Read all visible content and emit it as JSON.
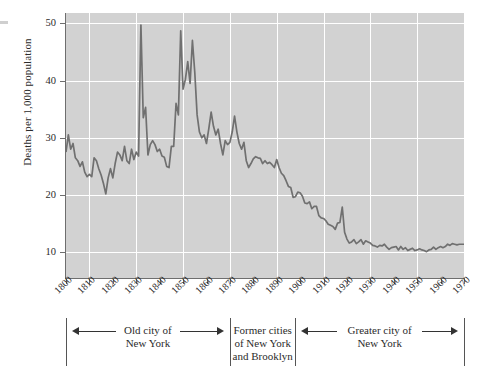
{
  "figure": {
    "kind": "line-chart",
    "background_color": "#ffffff",
    "plot_background_color": "#d2d2d2",
    "gridline_color": "#ffffff",
    "series_color": "#707070",
    "axis_color": "#6e6e6e"
  },
  "chart_data": {
    "type": "line",
    "title": "",
    "xlabel": "",
    "ylabel": "Deaths per 1,000 population",
    "xlim": [
      1800,
      1970
    ],
    "ylim": [
      5.5,
      51.8
    ],
    "grid": true,
    "legend": null,
    "yticks": [
      10,
      20,
      30,
      40,
      50
    ],
    "ytick_labels": [
      "10",
      "20",
      "30",
      "40",
      "50"
    ],
    "xticks": [
      1800,
      1810,
      1820,
      1830,
      1840,
      1850,
      1860,
      1870,
      1880,
      1890,
      1900,
      1910,
      1920,
      1930,
      1940,
      1950,
      1960,
      1970
    ],
    "xtick_labels": [
      "1800",
      "1810",
      "1820",
      "1830",
      "1840",
      "1850",
      "1860",
      "1870",
      "1880",
      "1890",
      "1900",
      "1910",
      "1920",
      "1930",
      "1940",
      "1950",
      "1960",
      "1970"
    ],
    "gridlines_x": [
      1810,
      1830,
      1850,
      1870,
      1890,
      1910,
      1930,
      1950,
      1970
    ],
    "gridlines_y": [
      10,
      20,
      30,
      40,
      50
    ],
    "series": [
      {
        "name": "Crude death rate, New York City",
        "x": [
          1800,
          1801,
          1802,
          1803,
          1804,
          1805,
          1806,
          1807,
          1808,
          1809,
          1810,
          1811,
          1812,
          1813,
          1814,
          1815,
          1816,
          1817,
          1818,
          1819,
          1820,
          1821,
          1822,
          1823,
          1824,
          1825,
          1826,
          1827,
          1828,
          1829,
          1830,
          1831,
          1832,
          1833,
          1834,
          1835,
          1836,
          1837,
          1838,
          1839,
          1840,
          1841,
          1842,
          1843,
          1844,
          1845,
          1846,
          1847,
          1848,
          1849,
          1850,
          1851,
          1852,
          1853,
          1854,
          1855,
          1856,
          1857,
          1858,
          1859,
          1860,
          1861,
          1862,
          1863,
          1864,
          1865,
          1866,
          1867,
          1868,
          1869,
          1870,
          1871,
          1872,
          1873,
          1874,
          1875,
          1876,
          1877,
          1878,
          1879,
          1880,
          1881,
          1882,
          1883,
          1884,
          1885,
          1886,
          1887,
          1888,
          1889,
          1890,
          1891,
          1892,
          1893,
          1894,
          1895,
          1896,
          1897,
          1898,
          1899,
          1900,
          1901,
          1902,
          1903,
          1904,
          1905,
          1906,
          1907,
          1908,
          1909,
          1910,
          1911,
          1912,
          1913,
          1914,
          1915,
          1916,
          1917,
          1918,
          1919,
          1920,
          1921,
          1922,
          1923,
          1924,
          1925,
          1926,
          1927,
          1928,
          1929,
          1930,
          1931,
          1932,
          1933,
          1934,
          1935,
          1936,
          1937,
          1938,
          1939,
          1940,
          1941,
          1942,
          1943,
          1944,
          1945,
          1946,
          1947,
          1948,
          1949,
          1950,
          1951,
          1952,
          1953,
          1954,
          1955,
          1956,
          1957,
          1958,
          1959,
          1960,
          1961,
          1962,
          1963,
          1964,
          1965,
          1966,
          1967,
          1968,
          1969,
          1970
        ],
        "values": [
          27.5,
          30.5,
          28.0,
          29.0,
          26.5,
          26.0,
          25.0,
          25.8,
          24.0,
          23.2,
          23.6,
          23.2,
          26.5,
          26.0,
          24.6,
          23.5,
          22.0,
          20.2,
          23.0,
          24.6,
          23.0,
          25.5,
          27.5,
          27.0,
          26.0,
          28.5,
          26.0,
          25.5,
          28.0,
          26.2,
          27.5,
          26.8,
          49.7,
          33.5,
          35.3,
          27.0,
          28.8,
          29.5,
          28.8,
          27.6,
          28.0,
          26.8,
          26.6,
          25.0,
          24.8,
          28.5,
          28.5,
          36.0,
          34.0,
          48.7,
          38.5,
          40.2,
          43.3,
          39.5,
          47.0,
          41.5,
          34.0,
          31.0,
          30.0,
          30.5,
          29.0,
          31.6,
          34.5,
          32.0,
          30.5,
          31.5,
          29.0,
          27.0,
          29.5,
          28.8,
          29.2,
          31.0,
          33.8,
          31.0,
          29.0,
          28.0,
          29.2,
          26.0,
          24.8,
          25.5,
          26.3,
          26.7,
          26.5,
          26.4,
          25.5,
          26.0,
          25.5,
          25.7,
          25.3,
          24.8,
          26.2,
          24.8,
          23.8,
          23.4,
          22.5,
          21.5,
          21.3,
          19.6,
          19.7,
          20.5,
          20.4,
          19.8,
          18.6,
          18.5,
          18.8,
          17.6,
          18.0,
          18.0,
          16.4,
          16.0,
          15.9,
          15.5,
          14.9,
          14.7,
          14.5,
          14.0,
          15.1,
          15.2,
          17.9,
          13.5,
          12.3,
          11.6,
          11.8,
          12.2,
          11.5,
          11.8,
          12.2,
          11.4,
          12.0,
          11.8,
          11.6,
          11.2,
          11.1,
          10.9,
          11.2,
          11.1,
          11.4,
          10.9,
          10.5,
          10.8,
          10.9,
          11.0,
          10.4,
          11.0,
          10.5,
          10.8,
          10.3,
          10.5,
          10.7,
          10.3,
          10.4,
          10.6,
          10.4,
          10.3,
          10.1,
          10.4,
          10.5,
          10.9,
          10.5,
          10.8,
          11.0,
          10.8,
          11.0,
          11.4,
          11.2,
          11.5,
          11.4,
          11.3,
          11.4,
          11.4,
          11.4
        ]
      }
    ],
    "annotations": [
      {
        "label": "Old city of\nNew York",
        "from": 1800,
        "to": 1870
      },
      {
        "label": "Former cities\nof New York\nand Brooklyn",
        "from": 1870,
        "to": 1898
      },
      {
        "label": "Greater city of\nNew York",
        "from": 1898,
        "to": 1970
      }
    ]
  },
  "annotation_brackets": [
    {
      "name": "old-city-of-new-york",
      "lines": [
        "Old city of",
        "New York"
      ],
      "arrows": "both"
    },
    {
      "name": "former-cities-of-new-york-and-brooklyn",
      "lines": [
        "Former cities",
        "of New York",
        "and Brooklyn"
      ],
      "arrows": "none"
    },
    {
      "name": "greater-city-of-new-york",
      "lines": [
        "Greater city of",
        "New York"
      ],
      "arrows": "both"
    }
  ]
}
